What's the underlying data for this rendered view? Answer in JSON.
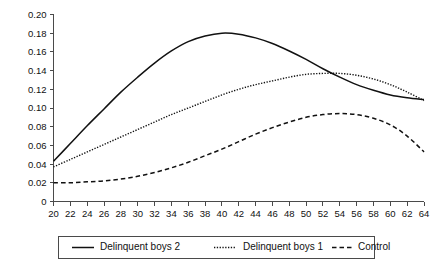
{
  "chart_data": {
    "type": "line",
    "title": "",
    "subtitle": "",
    "xlabel": "",
    "ylabel": "",
    "xlim": [
      20,
      64
    ],
    "ylim": [
      0,
      0.2
    ],
    "grid": false,
    "legend_position": "bottom",
    "x_ticks": [
      20,
      22,
      24,
      26,
      28,
      30,
      32,
      34,
      36,
      38,
      40,
      42,
      44,
      46,
      48,
      50,
      52,
      54,
      56,
      58,
      60,
      62,
      64
    ],
    "x_tick_labels": [
      "20",
      "22",
      "24",
      "26",
      "28",
      "30",
      "32",
      "34",
      "36",
      "38",
      "40",
      "42",
      "44",
      "46",
      "48",
      "50",
      "52",
      "54",
      "56",
      "58",
      "60",
      "62",
      "64"
    ],
    "y_ticks": [
      0,
      0.02,
      0.04,
      0.06,
      0.08,
      0.1,
      0.12,
      0.14,
      0.16,
      0.18,
      0.2
    ],
    "y_tick_labels": [
      "0",
      "0.02",
      "0.04",
      "0.06",
      "0.08",
      "0.10",
      "0.12",
      "0.14",
      "0.16",
      "0.18",
      "0.20"
    ],
    "x": [
      20,
      22,
      24,
      26,
      28,
      30,
      32,
      34,
      36,
      38,
      40,
      42,
      44,
      46,
      48,
      50,
      52,
      54,
      56,
      58,
      60,
      62,
      64
    ],
    "series": [
      {
        "name": "Delinquent boys 2",
        "style": "solid",
        "color": "#111111",
        "values": [
          0.043,
          0.062,
          0.081,
          0.099,
          0.117,
          0.133,
          0.148,
          0.161,
          0.171,
          0.177,
          0.18,
          0.179,
          0.175,
          0.169,
          0.161,
          0.152,
          0.142,
          0.133,
          0.125,
          0.119,
          0.114,
          0.111,
          0.109
        ]
      },
      {
        "name": "Delinquent boys 1",
        "style": "dotted",
        "color": "#111111",
        "values": [
          0.037,
          0.045,
          0.053,
          0.061,
          0.069,
          0.077,
          0.085,
          0.093,
          0.1,
          0.107,
          0.114,
          0.12,
          0.125,
          0.129,
          0.133,
          0.136,
          0.137,
          0.137,
          0.135,
          0.131,
          0.125,
          0.117,
          0.108
        ]
      },
      {
        "name": "Control",
        "style": "dashed",
        "color": "#111111",
        "values": [
          0.02,
          0.02,
          0.021,
          0.022,
          0.024,
          0.027,
          0.031,
          0.036,
          0.042,
          0.049,
          0.056,
          0.064,
          0.072,
          0.079,
          0.085,
          0.09,
          0.093,
          0.094,
          0.093,
          0.089,
          0.082,
          0.07,
          0.053
        ]
      }
    ]
  },
  "legend": {
    "entries": [
      {
        "label": "Delinquent boys 2",
        "style": "solid"
      },
      {
        "label": "Delinquent boys 1",
        "style": "dotted"
      },
      {
        "label": "Control",
        "style": "dashed"
      }
    ]
  }
}
